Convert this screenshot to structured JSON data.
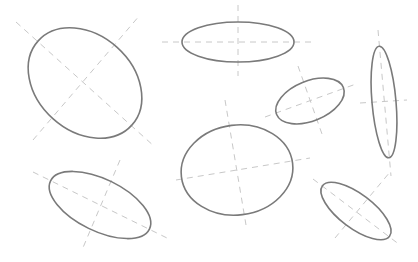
{
  "diagram": {
    "width": 418,
    "height": 262,
    "background": "#ffffff",
    "colors": {
      "ellipse_stroke": "#7a7a7a",
      "axis_dash": "#c8c8c8"
    },
    "ellipses": [
      {
        "id": "ellipse-1",
        "cx": 85,
        "cy": 83,
        "rx": 63,
        "ry": 48,
        "rotation": 42,
        "axes": [
          [
            16,
            22,
            155,
            147
          ],
          [
            33,
            140,
            140,
            15
          ]
        ]
      },
      {
        "id": "ellipse-2",
        "cx": 238,
        "cy": 42,
        "rx": 56,
        "ry": 20,
        "rotation": 0,
        "axes": [
          [
            162,
            42,
            312,
            42
          ],
          [
            238,
            5,
            238,
            76
          ]
        ]
      },
      {
        "id": "ellipse-3",
        "cx": 310,
        "cy": 101,
        "rx": 36,
        "ry": 20,
        "rotation": -22,
        "axes": [
          [
            265,
            117,
            356,
            84
          ],
          [
            298,
            66,
            322,
            134
          ]
        ]
      },
      {
        "id": "ellipse-4",
        "cx": 384,
        "cy": 102,
        "rx": 12,
        "ry": 56,
        "rotation": -5,
        "axes": [
          [
            378,
            30,
            391,
            176
          ],
          [
            360,
            103,
            407,
            100
          ]
        ]
      },
      {
        "id": "ellipse-5",
        "cx": 237,
        "cy": 170,
        "rx": 56,
        "ry": 45,
        "rotation": -7,
        "axes": [
          [
            176,
            180,
            310,
            158
          ],
          [
            225,
            100,
            246,
            225
          ]
        ]
      },
      {
        "id": "ellipse-6",
        "cx": 100,
        "cy": 205,
        "rx": 55,
        "ry": 26,
        "rotation": 26,
        "axes": [
          [
            33,
            172,
            167,
            238
          ],
          [
            120,
            160,
            82,
            250
          ]
        ]
      },
      {
        "id": "ellipse-7",
        "cx": 356,
        "cy": 211,
        "rx": 42,
        "ry": 17,
        "rotation": 37,
        "axes": [
          [
            313,
            179,
            400,
            245
          ],
          [
            335,
            238,
            390,
            172
          ]
        ]
      }
    ]
  }
}
